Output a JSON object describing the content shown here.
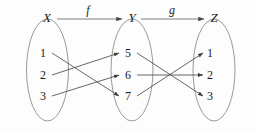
{
  "figure": {
    "kind": "function-composition-diagram",
    "background_color": "#fdfdfd",
    "width": 255,
    "height": 131
  },
  "sets": [
    {
      "id": "X",
      "label": "X",
      "label_x": 47,
      "label_y": 22,
      "ellipse": {
        "cx": 47.5,
        "cy": 70,
        "rx": 21,
        "ry": 51
      },
      "elements": [
        {
          "label": "1",
          "x": 43,
          "y": 57
        },
        {
          "label": "2",
          "x": 43,
          "y": 78
        },
        {
          "label": "3",
          "x": 43,
          "y": 99
        }
      ]
    },
    {
      "id": "Y",
      "label": "Y",
      "label_x": 132,
      "label_y": 22,
      "ellipse": {
        "cx": 132,
        "cy": 70,
        "rx": 21,
        "ry": 51
      },
      "elements": [
        {
          "label": "5",
          "x": 128,
          "y": 57
        },
        {
          "label": "6",
          "x": 128,
          "y": 78
        },
        {
          "label": "7",
          "x": 128,
          "y": 99
        }
      ]
    },
    {
      "id": "Z",
      "label": "Z",
      "label_x": 214,
      "label_y": 22,
      "ellipse": {
        "cx": 214,
        "cy": 70,
        "rx": 21,
        "ry": 51
      },
      "elements": [
        {
          "label": "1",
          "x": 210,
          "y": 57
        },
        {
          "label": "2",
          "x": 210,
          "y": 78
        },
        {
          "label": "3",
          "x": 210,
          "y": 99
        }
      ]
    }
  ],
  "maps": [
    {
      "id": "f",
      "label": "f",
      "label_x": 88,
      "label_y": 16,
      "from": "X",
      "to": "Y",
      "arrow_x1": 57,
      "arrow_x2": 122,
      "arrow_y": 22
    },
    {
      "id": "g",
      "label": "g",
      "label_x": 172,
      "label_y": 16,
      "from": "Y",
      "to": "Z",
      "arrow_x1": 141,
      "arrow_x2": 204,
      "arrow_y": 22
    }
  ],
  "mappings": {
    "f": [
      {
        "from": "1",
        "to": "7",
        "x1": 52,
        "y1": 53,
        "x2": 119,
        "y2": 96
      },
      {
        "from": "2",
        "to": "5",
        "x1": 52,
        "y1": 75,
        "x2": 119,
        "y2": 53
      },
      {
        "from": "3",
        "to": "6",
        "x1": 52,
        "y1": 96,
        "x2": 119,
        "y2": 75
      }
    ],
    "g": [
      {
        "from": "5",
        "to": "3",
        "x1": 137,
        "y1": 53,
        "x2": 203,
        "y2": 96
      },
      {
        "from": "6",
        "to": "2",
        "x1": 137,
        "y1": 75,
        "x2": 203,
        "y2": 75
      },
      {
        "from": "7",
        "to": "1",
        "x1": 137,
        "y1": 96,
        "x2": 203,
        "y2": 53
      }
    ]
  },
  "colors": {
    "ellipse_stroke": "#8d8d8d",
    "map_arrow": "#6f6f6f",
    "element_arrow": "#4a4a4a",
    "text": "#1a1a1a"
  }
}
